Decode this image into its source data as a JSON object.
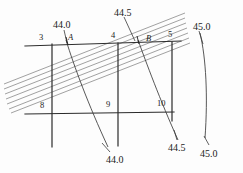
{
  "figure": {
    "background_color": "#fdfdfd",
    "line_color": "#2b2b2b",
    "hatch_color": "#6e6e6e",
    "contour_color": "#3a3a3a",
    "text_color": "#1a1a1a",
    "top_artifact_text": ""
  },
  "grid_labels": {
    "top": [
      {
        "text": "3",
        "x": 39,
        "y": 33
      },
      {
        "text": "4",
        "x": 111,
        "y": 31
      },
      {
        "text": "5",
        "x": 168,
        "y": 30
      }
    ],
    "bottom": [
      {
        "text": "8",
        "x": 40,
        "y": 101
      },
      {
        "text": "9",
        "x": 106,
        "y": 100
      },
      {
        "text": "10",
        "x": 157,
        "y": 99
      }
    ]
  },
  "point_labels": [
    {
      "text": "A",
      "x": 68,
      "y": 33
    },
    {
      "text": "B",
      "x": 146,
      "y": 34
    }
  ],
  "contour_labels": [
    {
      "text": "44.0",
      "x": 53,
      "y": 20
    },
    {
      "text": "44.5",
      "x": 114,
      "y": 8
    },
    {
      "text": "45.0",
      "x": 193,
      "y": 22
    },
    {
      "text": "44.0",
      "x": 106,
      "y": 155
    },
    {
      "text": "44.5",
      "x": 168,
      "y": 143
    },
    {
      "text": "45.0",
      "x": 200,
      "y": 149
    }
  ],
  "contour_values": [
    "44.0",
    "44.5",
    "45.0"
  ],
  "hatch_band": {
    "line_count": 7,
    "slope_label": "up-to-the-right",
    "stroke_width": 0.7
  },
  "frame": {
    "top_line": {
      "x1": 25,
      "y1": 46,
      "x2": 181,
      "y2": 41
    },
    "mid_line": {
      "x1": 25,
      "y1": 114,
      "x2": 174,
      "y2": 112
    },
    "verticals": [
      {
        "x1": 52,
        "y1": 44,
        "x2": 52,
        "y2": 147
      },
      {
        "x1": 118,
        "y1": 43,
        "x2": 118,
        "y2": 146
      },
      {
        "x1": 172,
        "y1": 42,
        "x2": 172,
        "y2": 121
      }
    ]
  }
}
